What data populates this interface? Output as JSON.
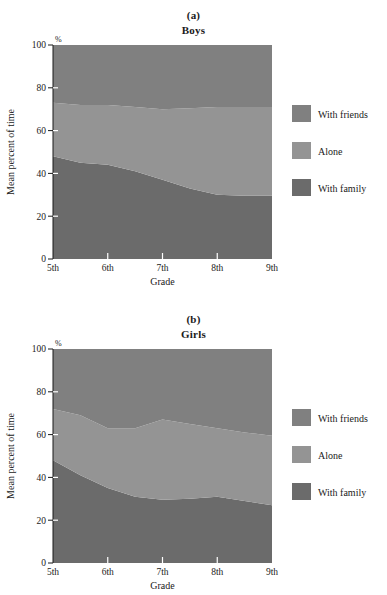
{
  "figure": {
    "axis_color": "#1a1a1a",
    "background": "#ffffff"
  },
  "colors": {
    "with_friends": "#808080",
    "alone": "#949494",
    "with_family": "#6b6b6b"
  },
  "legend": {
    "items": [
      {
        "label": "With friends",
        "color": "#808080"
      },
      {
        "label": "Alone",
        "color": "#949494"
      },
      {
        "label": "With family",
        "color": "#6b6b6b"
      }
    ]
  },
  "panels": [
    {
      "letter": "(a)",
      "title": "Boys",
      "xlabel": "Grade",
      "ylabel": "Mean percent of time",
      "unit": "%"
    },
    {
      "letter": "(b)",
      "title": "Girls",
      "xlabel": "Grade",
      "ylabel": "Mean percent of time",
      "unit": "%"
    }
  ],
  "axis": {
    "x_ticks": [
      "5th",
      "6th",
      "7th",
      "8th",
      "9th"
    ],
    "y_ticks": [
      "0",
      "20",
      "40",
      "60",
      "80",
      "100"
    ],
    "ylim": [
      0,
      100
    ],
    "xlim_labels": [
      "5th",
      "9th"
    ]
  },
  "chart_data": [
    {
      "type": "area",
      "title": "Boys",
      "subtitle": "(a)",
      "xlabel": "Grade",
      "ylabel": "Mean percent of time",
      "unit": "%",
      "ylim": [
        0,
        100
      ],
      "grid": false,
      "legend_position": "right",
      "stacked": true,
      "categories": [
        "5th",
        "6th",
        "7th",
        "8th",
        "9th"
      ],
      "x": [
        5,
        5.5,
        6,
        6.5,
        7,
        7.5,
        8,
        8.5,
        9
      ],
      "series": [
        {
          "name": "With family",
          "color": "#6b6b6b",
          "values": [
            48,
            45,
            44,
            41,
            37,
            33,
            30,
            29.5,
            29.5
          ]
        },
        {
          "name": "Alone",
          "color": "#949494",
          "values": [
            25,
            27,
            28,
            30,
            33,
            37.5,
            41,
            41.5,
            41.5
          ]
        },
        {
          "name": "With friends",
          "color": "#808080",
          "values": [
            27,
            28,
            28,
            29,
            30,
            29.5,
            29,
            29,
            29
          ]
        }
      ],
      "cumulative_boundaries": {
        "family_top": [
          48,
          45,
          44,
          41,
          37,
          33,
          30,
          29.5,
          29.5
        ],
        "alone_top": [
          73,
          72,
          72,
          71,
          70,
          70.5,
          71,
          71,
          71
        ]
      }
    },
    {
      "type": "area",
      "title": "Girls",
      "subtitle": "(b)",
      "xlabel": "Grade",
      "ylabel": "Mean percent of time",
      "unit": "%",
      "ylim": [
        0,
        100
      ],
      "grid": false,
      "legend_position": "right",
      "stacked": true,
      "categories": [
        "5th",
        "6th",
        "7th",
        "8th",
        "9th"
      ],
      "x": [
        5,
        5.5,
        6,
        6.5,
        7,
        7.5,
        8,
        8.5,
        9
      ],
      "series": [
        {
          "name": "With family",
          "color": "#6b6b6b",
          "values": [
            48,
            41,
            35,
            31,
            29.5,
            30,
            31,
            29,
            27
          ]
        },
        {
          "name": "Alone",
          "color": "#949494",
          "values": [
            24,
            28,
            28,
            32,
            37.5,
            35,
            32,
            32,
            32.5
          ]
        },
        {
          "name": "With friends",
          "color": "#808080",
          "values": [
            28,
            31,
            37,
            37,
            33,
            35,
            37,
            39,
            40.5
          ]
        }
      ],
      "cumulative_boundaries": {
        "family_top": [
          48,
          41,
          35,
          31,
          29.5,
          30,
          31,
          29,
          27
        ],
        "alone_top": [
          72,
          69,
          63,
          63,
          67,
          65,
          63,
          61,
          59.5
        ]
      }
    }
  ]
}
